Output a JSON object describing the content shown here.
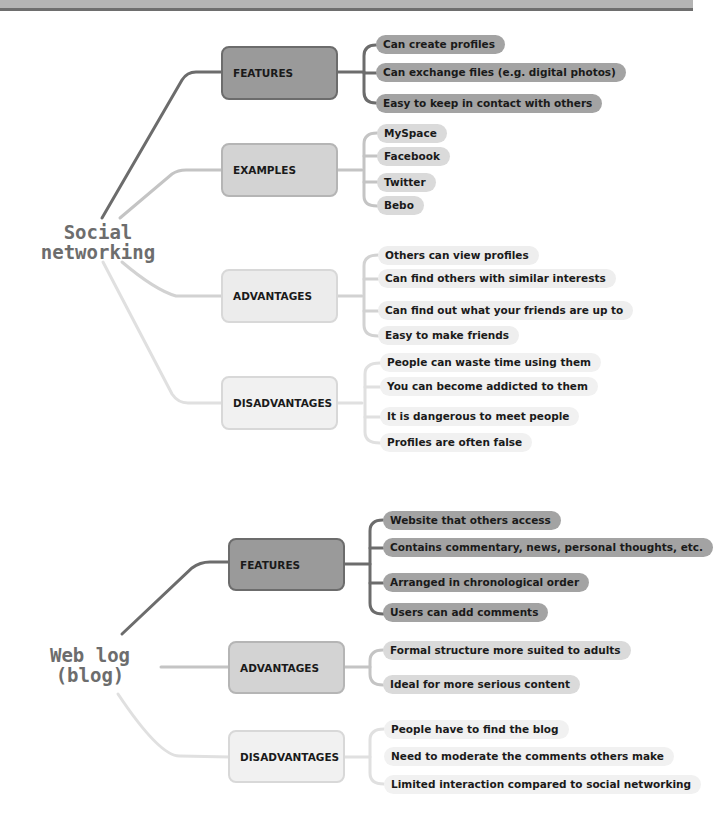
{
  "diagram": {
    "type": "mind-map",
    "colors": {
      "dark": "#9a9a9a",
      "mid": "#d3d3d3",
      "light": "#ececec",
      "root_text": "#6d6d6d"
    },
    "maps": [
      {
        "root": {
          "line1": "Social",
          "line2": "networking"
        },
        "branches": [
          {
            "label": "FEATURES",
            "items": [
              "Can create profiles",
              "Can exchange files (e.g. digital photos)",
              "Easy to keep in contact with others"
            ]
          },
          {
            "label": "EXAMPLES",
            "items": [
              "MySpace",
              "Facebook",
              "Twitter",
              "Bebo"
            ]
          },
          {
            "label": "ADVANTAGES",
            "items": [
              "Others can view profiles",
              "Can find others with similar interests",
              "Can find out what your friends are up to",
              "Easy to make friends"
            ]
          },
          {
            "label": "DISADVANTAGES",
            "items": [
              "People can waste time using them",
              "You can become addicted to them",
              "It is dangerous to meet people",
              "Profiles are often false"
            ]
          }
        ]
      },
      {
        "root": {
          "line1": "Web log",
          "line2": "(blog)"
        },
        "branches": [
          {
            "label": "FEATURES",
            "items": [
              "Website that others access",
              "Contains commentary, news, personal thoughts, etc.",
              "Arranged in chronological order",
              "Users can add comments"
            ]
          },
          {
            "label": "ADVANTAGES",
            "items": [
              "Formal structure more suited to adults",
              "Ideal for more serious content"
            ]
          },
          {
            "label": "DISADVANTAGES",
            "items": [
              "People have to find the blog",
              "Need to moderate the comments others make",
              "Limited interaction compared to social networking"
            ]
          }
        ]
      }
    ]
  }
}
